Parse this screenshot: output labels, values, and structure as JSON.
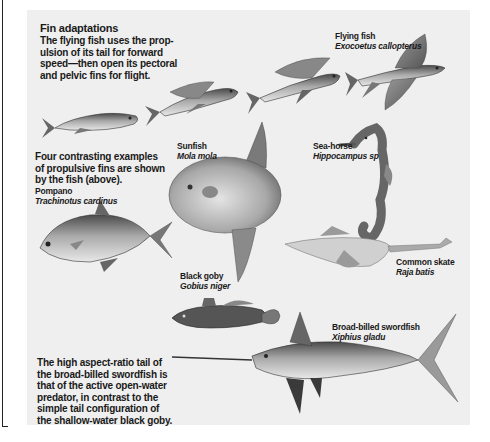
{
  "figure": {
    "title": "Fin adaptations",
    "intro": [
      "The flying fish uses the prop-",
      "ulsion of its tail for forward",
      "speed—then open its pectoral",
      "and pelvic fins for flight."
    ],
    "contrast_note": [
      "Four contrasting examples",
      "of propulsive fins are shown",
      "by the fish (above)."
    ],
    "closing_note": [
      "The high aspect-ratio tail of",
      "the broad-billed swordfish is",
      "that of the active open-water",
      "predator, in contrast to the",
      "simple tail configuration of",
      "the shallow-water black goby."
    ]
  },
  "species": [
    {
      "common": "Flying fish",
      "latin": "Exocoetus callopterus",
      "illustration": "flying-fish-sequence"
    },
    {
      "common": "Pompano",
      "latin": "Trachinotus cardinus",
      "illustration": "pompano"
    },
    {
      "common": "Sunfish",
      "latin": "Mola mola",
      "illustration": "sunfish"
    },
    {
      "common": "Sea-horse",
      "latin": "Hippocampus sp",
      "illustration": "sea-horse"
    },
    {
      "common": "Common skate",
      "latin": "Raja batis",
      "illustration": "skate"
    },
    {
      "common": "Black goby",
      "latin": "Gobius niger",
      "illustration": "goby"
    },
    {
      "common": "Broad-billed swordfish",
      "latin": "Xiphius gladu",
      "illustration": "swordfish"
    }
  ],
  "colors": {
    "panel_bg": "#efefef",
    "text": "#1a1a1a",
    "fish_dark": "#3a3a3a",
    "fish_mid": "#8a8a8a",
    "fish_light": "#d6d6d6"
  }
}
